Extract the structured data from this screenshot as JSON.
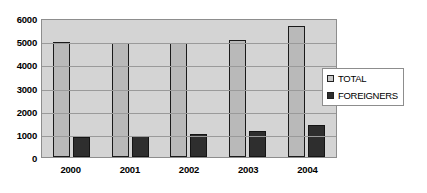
{
  "chart_data": {
    "type": "bar",
    "title": "",
    "xlabel": "",
    "ylabel": "",
    "categories": [
      "2000",
      "2001",
      "2002",
      "2003",
      "2004"
    ],
    "series": [
      {
        "name": "TOTAL",
        "color": "#b9b9b9",
        "values": [
          4950,
          4930,
          4900,
          5050,
          5650
        ]
      },
      {
        "name": "FOREIGNERS",
        "color": "#2e2e2e",
        "values": [
          870,
          920,
          1000,
          1130,
          1370
        ]
      }
    ],
    "ylim": [
      0,
      6000
    ],
    "yticks": [
      "0",
      "1000",
      "2000",
      "3000",
      "4000",
      "5000",
      "6000"
    ],
    "grid": true,
    "legend_position": "right"
  },
  "legend": {
    "items": [
      {
        "label": "TOTAL",
        "swatch": "legend-swatch-total"
      },
      {
        "label": "FOREIGNERS",
        "swatch": "legend-swatch-foreigners"
      }
    ]
  },
  "colors": {
    "plot_background": "#d4d4d4",
    "gridline": "#9a9a9a",
    "total_bar": "#b9b9b9",
    "foreigners_bar": "#2e2e2e",
    "axis_text": "#000000"
  }
}
